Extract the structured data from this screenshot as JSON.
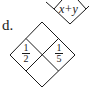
{
  "problem": {
    "label": "d.",
    "diamond": {
      "top": "",
      "bottom": "",
      "left": {
        "numerator": "1",
        "denominator": "2"
      },
      "right": {
        "numerator": "1",
        "denominator": "5"
      }
    }
  },
  "previous_problem": {
    "bottom_cell": "x+y"
  },
  "colors": {
    "ink": "#1a1a1a",
    "background": "#ffffff"
  }
}
